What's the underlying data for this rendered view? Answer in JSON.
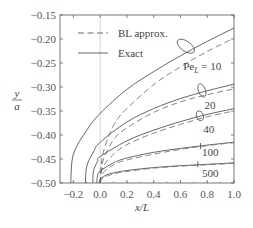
{
  "chart_data": {
    "type": "line",
    "title": "",
    "xlabel": "x/L",
    "ylabel": "y/a",
    "xlim": [
      -0.3,
      1.0
    ],
    "ylim": [
      -0.5,
      -0.15
    ],
    "xticks": [
      -0.2,
      0.0,
      0.2,
      0.4,
      0.6,
      0.8,
      1.0
    ],
    "xtick_labels": [
      "−0.2",
      "0.0",
      "0.2",
      "0.4",
      "0.6",
      "0.8",
      "1.0"
    ],
    "yticks": [
      -0.15,
      -0.2,
      -0.25,
      -0.3,
      -0.35,
      -0.4,
      -0.45,
      -0.5
    ],
    "ytick_labels": [
      "−0.15",
      "−0.20",
      "−0.25",
      "−0.30",
      "−0.35",
      "−0.40",
      "−0.45",
      "−0.50"
    ],
    "grid": false,
    "reference_line": {
      "x": 0.0,
      "color": "#c8c8c8"
    },
    "legend": {
      "position": "upper left",
      "entries": [
        {
          "label": "BL approx.",
          "style": "dashed"
        },
        {
          "label": "Exact",
          "style": "solid"
        }
      ]
    },
    "series": [
      {
        "name": "Exact, Pe_L = 10",
        "style": "solid",
        "x_start": -0.22,
        "x": [
          -0.22,
          -0.2,
          -0.1,
          0.0,
          0.2,
          0.4,
          0.6,
          0.8,
          1.0
        ],
        "y": [
          -0.5,
          -0.44,
          -0.39,
          -0.355,
          -0.305,
          -0.268,
          -0.235,
          -0.205,
          -0.177
        ]
      },
      {
        "name": "BL approx., Pe_L = 10",
        "style": "dashed",
        "x_start": 0.0,
        "x": [
          0.0,
          0.02,
          0.1,
          0.2,
          0.4,
          0.6,
          0.8,
          1.0
        ],
        "y": [
          -0.5,
          -0.44,
          -0.38,
          -0.345,
          -0.295,
          -0.258,
          -0.226,
          -0.198
        ]
      },
      {
        "name": "Exact, Pe_L = 20",
        "style": "solid",
        "x_start": -0.11,
        "x": [
          -0.11,
          -0.1,
          -0.05,
          0.0,
          0.2,
          0.4,
          0.6,
          0.8,
          1.0
        ],
        "y": [
          -0.5,
          -0.465,
          -0.435,
          -0.415,
          -0.373,
          -0.345,
          -0.324,
          -0.308,
          -0.294
        ]
      },
      {
        "name": "BL approx., Pe_L = 20",
        "style": "dashed",
        "x_start": 0.0,
        "x": [
          0.0,
          0.02,
          0.1,
          0.2,
          0.4,
          0.6,
          0.8,
          1.0
        ],
        "y": [
          -0.5,
          -0.455,
          -0.41,
          -0.385,
          -0.353,
          -0.331,
          -0.316,
          -0.304
        ]
      },
      {
        "name": "Exact, Pe_L = 40",
        "style": "solid",
        "x_start": -0.055,
        "x": [
          -0.055,
          -0.05,
          -0.02,
          0.0,
          0.2,
          0.4,
          0.6,
          0.8,
          1.0
        ],
        "y": [
          -0.5,
          -0.475,
          -0.455,
          -0.445,
          -0.412,
          -0.39,
          -0.372,
          -0.357,
          -0.345
        ]
      },
      {
        "name": "BL approx., Pe_L = 40",
        "style": "dashed",
        "x_start": 0.0,
        "x": [
          0.0,
          0.02,
          0.1,
          0.2,
          0.4,
          0.6,
          0.8,
          1.0
        ],
        "y": [
          -0.5,
          -0.467,
          -0.44,
          -0.42,
          -0.396,
          -0.378,
          -0.362,
          -0.35
        ]
      },
      {
        "name": "Exact, Pe_L = 100",
        "style": "solid",
        "x_start": -0.025,
        "x": [
          -0.025,
          -0.02,
          0.0,
          0.1,
          0.2,
          0.4,
          0.6,
          0.8,
          1.0
        ],
        "y": [
          -0.5,
          -0.485,
          -0.475,
          -0.458,
          -0.448,
          -0.436,
          -0.428,
          -0.421,
          -0.415
        ]
      },
      {
        "name": "BL approx., Pe_L = 100",
        "style": "dashed",
        "x_start": 0.0,
        "x": [
          0.0,
          0.02,
          0.1,
          0.2,
          0.4,
          0.6,
          0.8,
          1.0
        ],
        "y": [
          -0.5,
          -0.48,
          -0.462,
          -0.452,
          -0.44,
          -0.43,
          -0.422,
          -0.416
        ]
      },
      {
        "name": "Exact, Pe_L = 500",
        "style": "solid",
        "x_start": -0.005,
        "x": [
          -0.005,
          0.0,
          0.05,
          0.1,
          0.2,
          0.4,
          0.6,
          0.8,
          1.0
        ],
        "y": [
          -0.5,
          -0.492,
          -0.483,
          -0.479,
          -0.474,
          -0.468,
          -0.464,
          -0.461,
          -0.458
        ]
      },
      {
        "name": "BL approx., Pe_L = 500",
        "style": "dashed",
        "x_start": 0.0,
        "x": [
          0.0,
          0.02,
          0.1,
          0.2,
          0.4,
          0.6,
          0.8,
          1.0
        ],
        "y": [
          -0.5,
          -0.49,
          -0.481,
          -0.476,
          -0.469,
          -0.465,
          -0.462,
          -0.459
        ]
      }
    ],
    "annotations": [
      {
        "text": "Pe",
        "sub": "L",
        "suffix": " = 10",
        "x": 0.62,
        "y": -0.265,
        "ellipse": {
          "cx": 0.64,
          "cy": -0.215
        }
      },
      {
        "text": "20",
        "x": 0.78,
        "y": -0.345,
        "ellipse": {
          "cx": 0.76,
          "cy": -0.307
        }
      },
      {
        "text": "40",
        "x": 0.77,
        "y": -0.395,
        "ellipse": {
          "cx": 0.745,
          "cy": -0.36
        }
      },
      {
        "text": "100",
        "x": 0.76,
        "y": -0.443,
        "marker": {
          "cx": 0.75,
          "cy": -0.423
        }
      },
      {
        "text": "500",
        "x": 0.76,
        "y": -0.488,
        "marker": {
          "cx": 0.73,
          "cy": -0.461
        }
      }
    ]
  }
}
